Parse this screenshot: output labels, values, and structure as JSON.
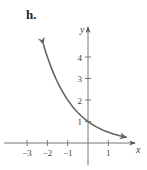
{
  "panel": {
    "label": "h."
  },
  "chart_data": {
    "type": "line",
    "title": "",
    "function": "y = 2^(-x)",
    "xlabel": "x",
    "ylabel": "y",
    "x_ticks": [
      -3,
      -2,
      -1,
      1
    ],
    "x_tick_labels": [
      "−3",
      "−2",
      "−1",
      "1"
    ],
    "y_ticks": [
      1,
      2,
      3,
      4
    ],
    "y_tick_labels": [
      "1",
      "2",
      "3",
      "4"
    ],
    "xlim": [
      -3.8,
      2.1
    ],
    "ylim": [
      -0.9,
      5.0
    ],
    "grid": false,
    "legend": null,
    "series": [
      {
        "name": "curve",
        "x": [
          -2.2,
          -2,
          -1.5,
          -1,
          -0.5,
          0,
          0.5,
          1,
          1.5,
          1.9
        ],
        "y": [
          4.59,
          4,
          2.83,
          2,
          1.41,
          1,
          0.71,
          0.5,
          0.35,
          0.27
        ],
        "arrows": "both",
        "color": "#666666"
      }
    ],
    "annotations": [
      {
        "text": "point (0,1) marked on y-axis"
      }
    ]
  }
}
